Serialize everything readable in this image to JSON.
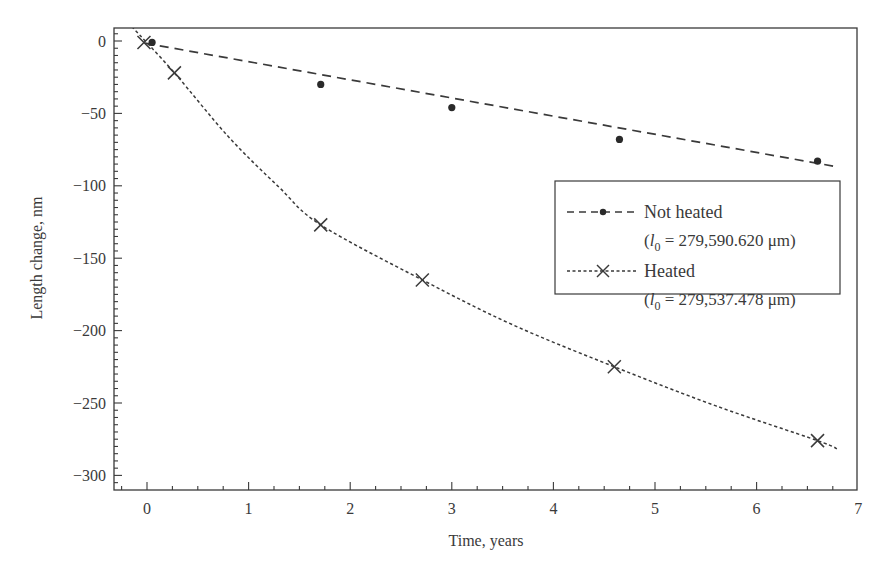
{
  "chart_data": {
    "type": "scatter",
    "title": "",
    "xlabel": "Time, years",
    "ylabel": "Length change, nm",
    "xlim": [
      -0.3,
      7
    ],
    "ylim": [
      -310,
      10
    ],
    "xticks": [
      0,
      1,
      2,
      3,
      4,
      5,
      6,
      7
    ],
    "xtick_labels": [
      "0",
      "1",
      "2",
      "3",
      "4",
      "5",
      "6",
      "7"
    ],
    "yticks": [
      0,
      -50,
      -100,
      -150,
      -200,
      -250,
      -300
    ],
    "ytick_labels": [
      "0",
      "−50",
      "−100",
      "−150",
      "−200",
      "−250",
      "−300"
    ],
    "x_minor_step": 0.25,
    "y_minor_step": 5,
    "grid": false,
    "legend_position": "right, upper-middle (inside plot)",
    "series": [
      {
        "name": "Not heated",
        "legend_label": "Not heated",
        "legend_sub_prefix": "(",
        "legend_sub_var": "l",
        "legend_sub_index": "0",
        "legend_sub_value": " = 279,590.620 μm)",
        "marker": "dot",
        "line_style": "dashed",
        "color": "#3a3a3a",
        "x": [
          0.05,
          1.71,
          3.0,
          4.65,
          6.6
        ],
        "y": [
          -1,
          -30,
          -46,
          -68,
          -83
        ],
        "fit": {
          "type": "linear",
          "x": [
            0.0,
            6.8
          ],
          "y": [
            -2,
            -87
          ]
        }
      },
      {
        "name": "Heated",
        "legend_label": "Heated",
        "legend_sub_prefix": "(",
        "legend_sub_var": "l",
        "legend_sub_index": "0",
        "legend_sub_value": " = 279,537.478 μm)",
        "marker": "cross",
        "line_style": "dotted",
        "color": "#3a3a3a",
        "x": [
          -0.03,
          0.27,
          1.71,
          2.71,
          4.6,
          6.6
        ],
        "y": [
          -1,
          -22,
          -127,
          -165,
          -225,
          -276
        ],
        "fit": {
          "type": "curve",
          "x": [
            -0.15,
            0.27,
            0.8,
            1.3,
            1.71,
            2.71,
            3.6,
            4.6,
            5.6,
            6.6,
            6.8
          ],
          "y": [
            10,
            -22,
            -66,
            -101,
            -127,
            -165,
            -196,
            -225,
            -252,
            -276,
            -282
          ]
        }
      }
    ]
  }
}
